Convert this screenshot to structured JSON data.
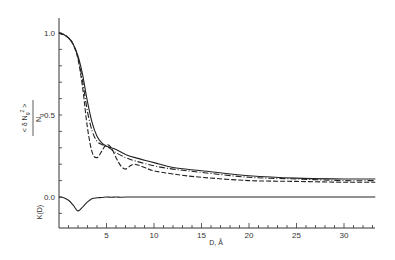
{
  "chart_data": {
    "type": "line",
    "title": "",
    "xlabel": "D, Å",
    "ylabel": "<δN_g²> / N_g",
    "ylabel_lower": "K(D)",
    "xlim": [
      0,
      33.3
    ],
    "ylim": [
      -0.18,
      1.1
    ],
    "grid": false,
    "legend": null,
    "x_ticks": [
      5,
      10,
      15,
      20,
      25,
      30
    ],
    "x_tick_labels": [
      "5",
      "10",
      "15",
      "20",
      "25",
      "30"
    ],
    "y_ticks": [
      0.0,
      0.5,
      1.0
    ],
    "y_tick_labels": [
      "0.0",
      "0.5",
      "1.0"
    ],
    "series": [
      {
        "name": "solid",
        "style": "solid",
        "x": [
          0,
          0.5,
          1,
          1.5,
          2,
          2.5,
          3,
          3.5,
          4,
          4.5,
          5,
          5.5,
          6,
          7,
          8,
          10,
          12,
          15,
          20,
          25,
          30,
          33.3
        ],
        "y": [
          1.0,
          0.99,
          0.97,
          0.93,
          0.86,
          0.74,
          0.58,
          0.45,
          0.37,
          0.33,
          0.31,
          0.3,
          0.29,
          0.26,
          0.24,
          0.21,
          0.18,
          0.16,
          0.13,
          0.115,
          0.11,
          0.11
        ]
      },
      {
        "name": "dash-dot",
        "style": "dashdot",
        "x": [
          0,
          0.5,
          1,
          1.5,
          2,
          2.5,
          3,
          3.5,
          4,
          4.5,
          5,
          5.5,
          6,
          7,
          8,
          10,
          12,
          15,
          20,
          25,
          30,
          33.3
        ],
        "y": [
          1.0,
          0.99,
          0.97,
          0.93,
          0.85,
          0.7,
          0.52,
          0.4,
          0.34,
          0.32,
          0.31,
          0.29,
          0.27,
          0.24,
          0.22,
          0.19,
          0.17,
          0.15,
          0.12,
          0.11,
          0.1,
          0.1
        ]
      },
      {
        "name": "dashed",
        "style": "dashed",
        "x": [
          0,
          0.5,
          1,
          1.5,
          2,
          2.5,
          3,
          3.5,
          4,
          4.5,
          5,
          5.5,
          6,
          6.5,
          7,
          7.5,
          8,
          9,
          10,
          12,
          15,
          20,
          25,
          30,
          33.3
        ],
        "y": [
          1.0,
          0.99,
          0.97,
          0.93,
          0.84,
          0.66,
          0.42,
          0.27,
          0.24,
          0.28,
          0.32,
          0.3,
          0.24,
          0.19,
          0.17,
          0.19,
          0.2,
          0.18,
          0.16,
          0.14,
          0.12,
          0.1,
          0.095,
          0.09,
          0.09
        ]
      },
      {
        "name": "K(D)",
        "style": "solid",
        "panel": "lower",
        "x": [
          0,
          0.5,
          1,
          1.5,
          2,
          2.5,
          3,
          3.5,
          4,
          4.5,
          5,
          5.5,
          6,
          6.5,
          7,
          8,
          10,
          15,
          20,
          25,
          30,
          33.3
        ],
        "y": [
          0.0,
          -0.005,
          -0.02,
          -0.05,
          -0.085,
          -0.06,
          -0.03,
          -0.01,
          -0.005,
          -0.003,
          0.0,
          -0.002,
          0.0,
          -0.002,
          0.0,
          0.0,
          0.0,
          0.0,
          0.0,
          0.0,
          0.0,
          0.0
        ]
      }
    ]
  }
}
